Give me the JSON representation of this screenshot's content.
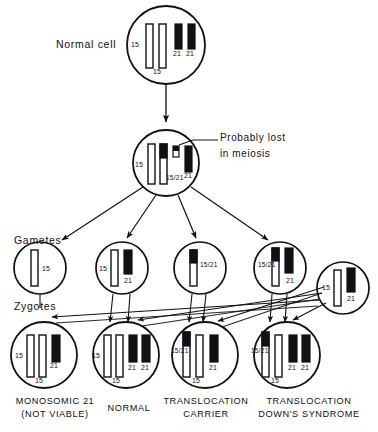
{
  "diagram": {
    "colors": {
      "ink": "#111111",
      "chromosome_15": "#ffffff",
      "chromosome_21": "#111111",
      "background": "#ffffff"
    }
  },
  "labels": {
    "normal_cell": "Normal cell",
    "gametes": "Gametes",
    "zygotes": "Zygotes",
    "probably_lost_line1": "Probably lost",
    "probably_lost_line2": "in meiosis"
  },
  "cells": {
    "normal_cell": {
      "name": "normal-cell",
      "chromosome_labels": {
        "left_15": "15",
        "bottom_15": "15",
        "left_21": "21",
        "right_21": "21"
      }
    },
    "carrier_cell": {
      "name": "carrier-parent-cell",
      "chromosome_labels": {
        "left_15": "15",
        "translocation": "15/21",
        "lost_fragment": "",
        "right_21": "21"
      }
    }
  },
  "gametes": [
    {
      "name": "gamete-15-only",
      "labels": [
        "15"
      ]
    },
    {
      "name": "gamete-normal-15-21",
      "labels": [
        "15",
        "21"
      ]
    },
    {
      "name": "gamete-translocation-only",
      "labels": [
        "15/21"
      ]
    },
    {
      "name": "gamete-translocation-plus-21",
      "labels": [
        "15/21",
        "21"
      ]
    },
    {
      "name": "gamete-partner-normal",
      "labels": [
        "15",
        "21"
      ]
    }
  ],
  "zygotes": [
    {
      "name": "zygote-monosomic-21",
      "caption_line1": "MONOSOMIC 21",
      "caption_line2": "(NOT VIABLE)",
      "labels": [
        "15",
        "15",
        "21"
      ]
    },
    {
      "name": "zygote-normal",
      "caption_line1": "NORMAL",
      "caption_line2": "",
      "labels": [
        "15",
        "15",
        "21",
        "21"
      ]
    },
    {
      "name": "zygote-translocation-carrier",
      "caption_line1": "TRANSLOCATION",
      "caption_line2": "CARRIER",
      "labels": [
        "15/21",
        "15",
        "21"
      ]
    },
    {
      "name": "zygote-translocation-downs",
      "caption_line1": "TRANSLOCATION",
      "caption_line2": "DOWN'S SYNDROME",
      "labels": [
        "15/21",
        "15",
        "21",
        "21"
      ]
    }
  ]
}
